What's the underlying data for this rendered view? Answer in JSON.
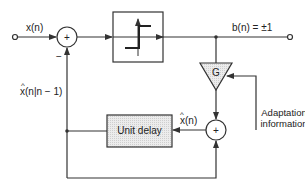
{
  "diagram": {
    "type": "adaptive delta modulator block diagram",
    "labels": {
      "input": "x(n)",
      "output": "b(n) = ±1",
      "prediction": "x(n|n − 1)",
      "prediction_hat": "^",
      "reconstructed": "x(n)",
      "reconstructed_hat": "^",
      "minus_sign": "−",
      "plus_sign": "+",
      "gain": "G",
      "unit_delay": "Unit delay",
      "adaptation_line1": "Adaptation",
      "adaptation_line2": "information"
    },
    "blocks": [
      {
        "id": "summer-1",
        "kind": "summing-junction",
        "symbol": "+"
      },
      {
        "id": "quantizer",
        "kind": "one-bit-quantizer"
      },
      {
        "id": "gain",
        "kind": "gain-triangle",
        "symbol": "G"
      },
      {
        "id": "summer-2",
        "kind": "summing-junction",
        "symbol": "+"
      },
      {
        "id": "unit-delay",
        "kind": "delay-box",
        "label": "Unit delay"
      }
    ],
    "colors": {
      "line": "#333333",
      "fill_shaded": "#e6e6e6",
      "background": "#ffffff"
    }
  }
}
